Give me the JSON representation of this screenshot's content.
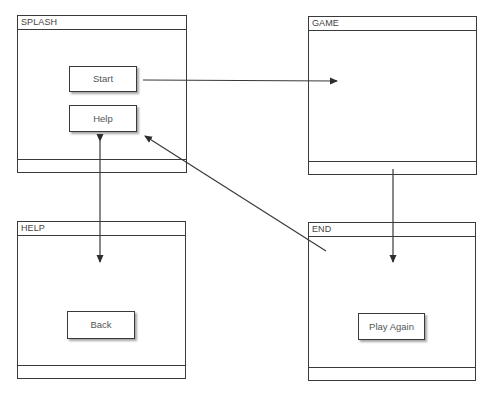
{
  "screens": {
    "splash": {
      "title": "SPLASH",
      "buttons": [
        {
          "label": "Start"
        },
        {
          "label": "Help"
        }
      ]
    },
    "game": {
      "title": "GAME"
    },
    "help": {
      "title": "HELP",
      "buttons": [
        {
          "label": "Back"
        }
      ]
    },
    "end": {
      "title": "END",
      "buttons": [
        {
          "label": "Play Again"
        }
      ]
    }
  },
  "connections": [
    {
      "from": "splash.start",
      "to": "game"
    },
    {
      "from": "game",
      "to": "end"
    },
    {
      "from": "splash.help",
      "to": "help",
      "bidirectional": true
    },
    {
      "from": "end",
      "to": "splash.help"
    }
  ],
  "colors": {
    "line": "#3a3a3a",
    "text": "#444444",
    "background": "#ffffff"
  }
}
